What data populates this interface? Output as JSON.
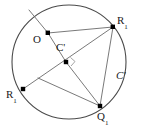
{
  "figure": {
    "type": "geometry-diagram",
    "canvas": {
      "width": 143,
      "height": 130
    },
    "colors": {
      "stroke": "#555555",
      "circle_stroke": "#4a4a4a",
      "point_fill": "#000000",
      "label_color": "#1a1a1a",
      "background": "#ffffff"
    },
    "circle": {
      "name": "circle-c-prime",
      "cx": 69,
      "cy": 62,
      "r": 57
    },
    "points": [
      {
        "id": "O",
        "label_base": "O",
        "label_sub": "",
        "x": 48,
        "y": 33,
        "label_x": 35,
        "label_y": 36
      },
      {
        "id": "R1_top",
        "label_base": "R",
        "label_sub": "1",
        "x": 113,
        "y": 27,
        "label_x": 117,
        "label_y": 17
      },
      {
        "id": "Cprime",
        "label_base": "C",
        "label_sub": "",
        "x": 66,
        "y": 62,
        "label_x": 57,
        "label_y": 45
      },
      {
        "id": "R1_left",
        "label_base": "R",
        "label_sub": "1",
        "x": 23,
        "y": 89,
        "label_x": 8,
        "label_y": 92
      },
      {
        "id": "Q1",
        "label_base": "Q",
        "label_sub": "1",
        "x": 100,
        "y": 106,
        "label_x": 98,
        "label_y": 112
      }
    ],
    "segments": [
      {
        "name": "segment-o-to-r1top",
        "x1": 48,
        "y1": 33,
        "x2": 113,
        "y2": 27
      },
      {
        "name": "segment-o-to-cprime",
        "x1": 48,
        "y1": 33,
        "x2": 66,
        "y2": 62
      },
      {
        "name": "segment-o-to-arc-upper-left",
        "x1": 48,
        "y1": 33,
        "x2": 30,
        "y2": 11
      },
      {
        "name": "segment-r1top-to-cprime-extended",
        "x1": 113,
        "y1": 27,
        "x2": 23,
        "y2": 89
      },
      {
        "name": "segment-r1top-to-q1",
        "x1": 113,
        "y1": 27,
        "x2": 100,
        "y2": 106
      },
      {
        "name": "segment-cprime-to-q1",
        "x1": 66,
        "y1": 62,
        "x2": 100,
        "y2": 106
      },
      {
        "name": "segment-q1-to-arc-left",
        "x1": 100,
        "y1": 106,
        "x2": 40,
        "y2": 80
      }
    ],
    "right_angle_marker": {
      "name": "right-angle-marker-at-cprime",
      "x": 66,
      "y": 62,
      "size": 6
    },
    "labels": {
      "center_label": {
        "base": "C",
        "prime": "'"
      },
      "circle_label": {
        "base": "C",
        "prime": "'",
        "x": 118,
        "y": 74
      },
      "point_o": "O",
      "r_base": "R",
      "r_sub": "1",
      "q_base": "Q",
      "q_sub": "1"
    }
  }
}
